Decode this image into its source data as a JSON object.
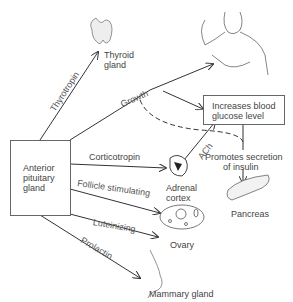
{
  "diagram": {
    "source_box": "Anterior pituitary gland",
    "source_lines": [
      "Anterior",
      "pituitary",
      "gland"
    ],
    "hormones": {
      "thyrotropin": "Thyrotropin",
      "growth": "Growth",
      "corticotropin": "Corticotropin",
      "follicle": "Follicle stimulating",
      "luteinizing": "Luteinizing",
      "prolactin": "Prolactin",
      "ach": "ACh"
    },
    "targets": {
      "thyroid": [
        "Thyroid",
        "gland"
      ],
      "adrenal": [
        "Adrenal",
        "cortex"
      ],
      "ovary": "Ovary",
      "pancreas": "Pancreas",
      "mammary": "Mammary gland"
    },
    "effects": {
      "glucose": [
        "Increases blood",
        "glucose level"
      ],
      "insulin": [
        "Promotes secretion",
        "of insulin"
      ]
    }
  }
}
